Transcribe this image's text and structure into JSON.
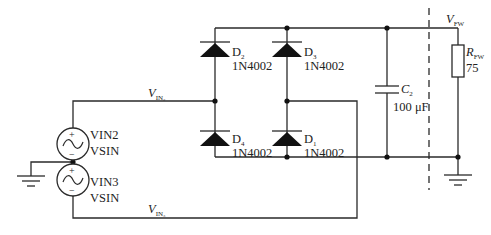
{
  "diagram": {
    "type": "circuit-schematic",
    "components": {
      "D2": {
        "ref": "D",
        "ref_sub": "2",
        "value": "1N4002"
      },
      "D3": {
        "ref": "D",
        "ref_sub": "3",
        "value": "1N4002"
      },
      "D4": {
        "ref": "D",
        "ref_sub": "4",
        "value": "1N4002"
      },
      "D1": {
        "ref": "D",
        "ref_sub": "1",
        "value": "1N4002"
      },
      "C2": {
        "ref": "C",
        "ref_sub": "2",
        "value": "100 μF"
      },
      "RFW": {
        "ref": "R",
        "ref_sub": "FW",
        "value": "75"
      },
      "VIN2": {
        "ref": "VIN2",
        "value": "VSIN",
        "plus": "+",
        "minus": "−"
      },
      "VIN3": {
        "ref": "VIN3",
        "value": "VSIN",
        "plus": "+",
        "minus": "−"
      }
    },
    "nets": {
      "vin2": {
        "label": "V",
        "sub": "IN₂"
      },
      "vin3": {
        "label": "V",
        "sub": "IN₃"
      },
      "vfw": {
        "label": "V",
        "sub": "FW"
      }
    },
    "colors": {
      "wire": "#2a2a2a",
      "background": "#ffffff"
    }
  }
}
